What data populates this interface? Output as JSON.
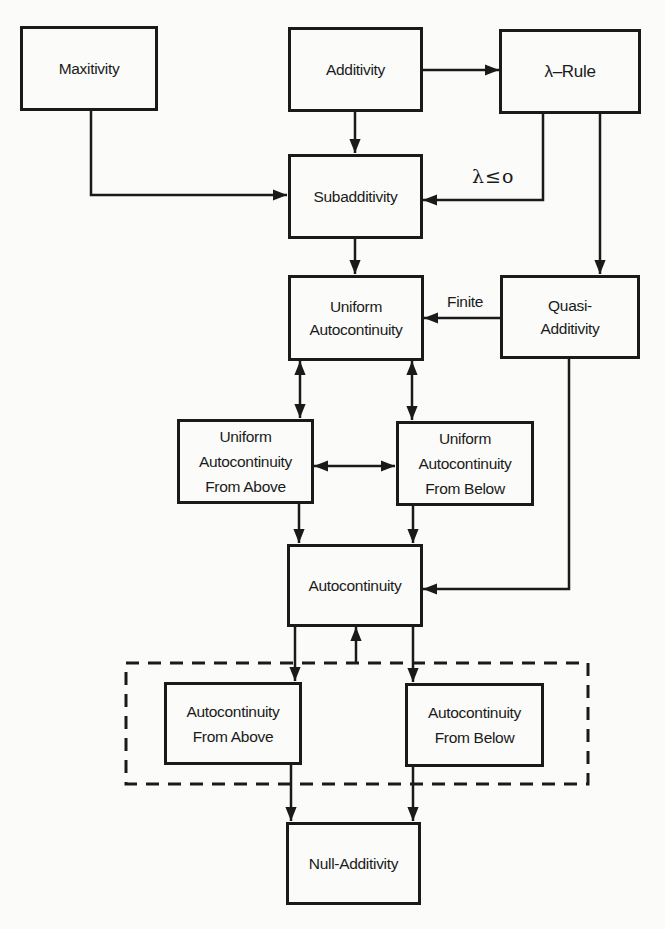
{
  "diagram": {
    "nodes": {
      "maxitivity": {
        "label": "Maxitivity"
      },
      "additivity": {
        "label": "Additivity"
      },
      "lambda_rule": {
        "label": "λ–Rule"
      },
      "subadditivity": {
        "label": "Subadditivity"
      },
      "uniform_autocontinuity": {
        "label": "Uniform\nAutocontinuity"
      },
      "quasi_additivity": {
        "label": "Quasi-\nAdditivity"
      },
      "ua_from_above": {
        "label": "Uniform\nAutocontinuity\nFrom Above"
      },
      "ua_from_below": {
        "label": "Uniform\nAutocontinuity\nFrom Below"
      },
      "autocontinuity": {
        "label": "Autocontinuity"
      },
      "ac_from_above": {
        "label": "Autocontinuity\nFrom Above"
      },
      "ac_from_below": {
        "label": "Autocontinuity\nFrom Below"
      },
      "null_additivity": {
        "label": "Null-Additivity"
      }
    },
    "edge_labels": {
      "lambda_condition": "λ≤o",
      "finite": "Finite"
    },
    "edges": [
      {
        "from": "Additivity",
        "to": "λ–Rule",
        "type": "arrow"
      },
      {
        "from": "Additivity",
        "to": "Subadditivity",
        "type": "arrow"
      },
      {
        "from": "Maxitivity",
        "to": "Subadditivity",
        "type": "arrow"
      },
      {
        "from": "λ–Rule",
        "to": "Subadditivity",
        "type": "arrow",
        "label": "λ≤o"
      },
      {
        "from": "λ–Rule",
        "to": "Quasi-Additivity",
        "type": "arrow"
      },
      {
        "from": "Subadditivity",
        "to": "Uniform Autocontinuity",
        "type": "arrow"
      },
      {
        "from": "Quasi-Additivity",
        "to": "Uniform Autocontinuity",
        "type": "arrow",
        "label": "Finite"
      },
      {
        "from": "Uniform Autocontinuity",
        "to": "Uniform Autocontinuity From Above",
        "type": "double-arrow"
      },
      {
        "from": "Uniform Autocontinuity",
        "to": "Uniform Autocontinuity From Below",
        "type": "double-arrow"
      },
      {
        "from": "Uniform Autocontinuity From Above",
        "to": "Uniform Autocontinuity From Below",
        "type": "double-arrow"
      },
      {
        "from": "Uniform Autocontinuity From Above",
        "to": "Autocontinuity",
        "type": "arrow"
      },
      {
        "from": "Uniform Autocontinuity From Below",
        "to": "Autocontinuity",
        "type": "arrow"
      },
      {
        "from": "Quasi-Additivity",
        "to": "Autocontinuity",
        "type": "arrow"
      },
      {
        "from": "Autocontinuity",
        "to": "Autocontinuity From Above",
        "type": "arrow"
      },
      {
        "from": "Autocontinuity",
        "to": "Autocontinuity From Below",
        "type": "arrow"
      },
      {
        "from": "Autocontinuity From Above + Autocontinuity From Below (group)",
        "to": "Autocontinuity",
        "type": "arrow"
      },
      {
        "from": "Autocontinuity From Above",
        "to": "Null-Additivity",
        "type": "arrow"
      },
      {
        "from": "Autocontinuity From Below",
        "to": "Null-Additivity",
        "type": "arrow"
      }
    ],
    "group": {
      "style": "dashed",
      "members": [
        "Autocontinuity From Above",
        "Autocontinuity From Below"
      ]
    },
    "colors": {
      "ink": "#1a1a1a",
      "paper": "#fbfbf9"
    }
  }
}
